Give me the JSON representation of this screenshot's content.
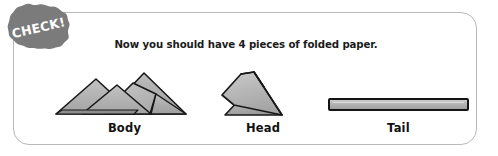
{
  "panel": {
    "background": "#ffffff",
    "border_color": "#b9b9b9"
  },
  "badge": {
    "label": "CHECK!",
    "icon": "starburst-seal-icon",
    "fill": "#7a7a7a",
    "text_color": "#ffffff"
  },
  "heading": {
    "text": "Now you should have 4 pieces of folded paper.",
    "color": "#1b1b1b"
  },
  "figures": [
    {
      "caption": "Body",
      "icon": "folded-paper-triangles-icon",
      "fill": "#b0b0b0",
      "stroke": "#1a1a1a"
    },
    {
      "caption": "Head",
      "icon": "folded-paper-wedge-icon",
      "fill": "#b0b0b0",
      "stroke": "#1a1a1a"
    },
    {
      "caption": "Tail",
      "icon": "folded-paper-strip-icon",
      "fill": "#b0b0b0",
      "stroke": "#1a1a1a"
    }
  ]
}
